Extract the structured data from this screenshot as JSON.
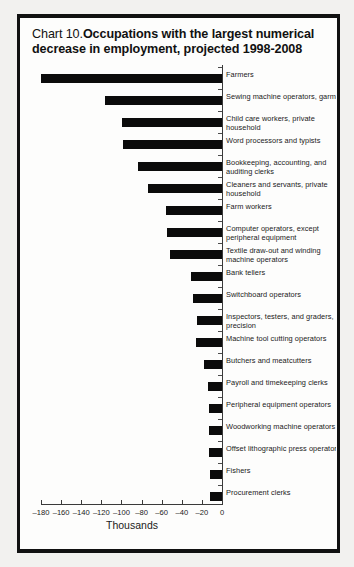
{
  "chart_data": {
    "type": "bar",
    "orientation": "horizontal",
    "title_prefix": "Chart 10. ",
    "title": "Occupations with the largest numerical decrease in employment, projected 1998-2008",
    "xlabel": "Thousands",
    "ylabel": "",
    "xlim": [
      -180,
      0
    ],
    "xticks": [
      -180,
      -160,
      -140,
      -120,
      -100,
      -80,
      -60,
      -40,
      -20,
      0
    ],
    "xticklabels": [
      "–180",
      "–160",
      "–140",
      "–120",
      "–100",
      "–80",
      "–60",
      "–40",
      "–20",
      "0"
    ],
    "grid": false,
    "legend": "none",
    "bar_color": "#0b0b0b",
    "categories": [
      "Farmers",
      "Sewing machine operators, garment",
      "Child care workers, private household",
      "Word processors and typists",
      "Bookkeeping, accounting, and auditing clerks",
      "Cleaners and servants, private household",
      "Farm workers",
      "Computer operators, except peripheral equipment",
      "Textile draw-out and winding machine operators",
      "Bank tellers",
      "Switchboard operators",
      "Inspectors, testers, and graders, precision",
      "Machine tool cutting operators",
      "Butchers and meatcutters",
      "Payroll and timekeeping clerks",
      "Peripheral equipment operators",
      "Woodworking machine operators",
      "Offset lithographic press operators",
      "Fishers",
      "Procurement clerks"
    ],
    "values": [
      -180,
      -116,
      -99,
      -98,
      -84,
      -74,
      -56,
      -55,
      -52,
      -31,
      -29,
      -25,
      -26,
      -18,
      -14,
      -13,
      -13,
      -13,
      -12,
      -12
    ]
  },
  "chart_title": {
    "label_prefix": "Chart 10.",
    "label_bold": "Occupations with the largest numerical decrease in employment, projected 1998-2008"
  }
}
